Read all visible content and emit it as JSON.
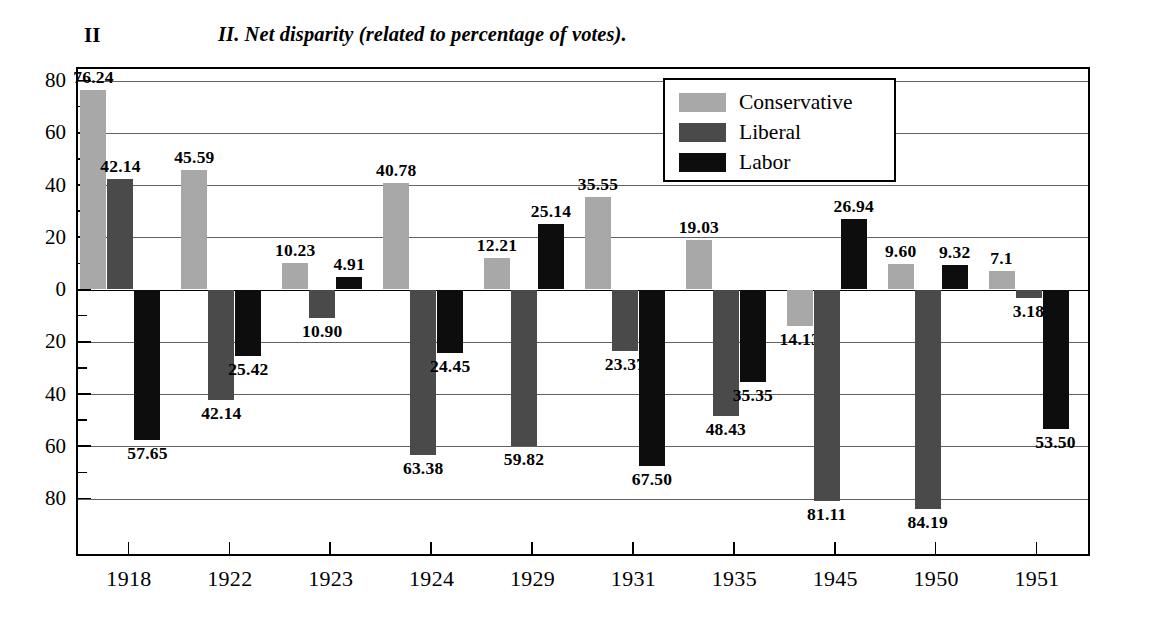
{
  "figure": {
    "number": "II",
    "title": "II. Net disparity (related to percentage of votes)."
  },
  "legend": {
    "position": "top-right",
    "entries": [
      {
        "label": "Conservative",
        "color": "#a8a8a8",
        "swatch_name": "legend-swatch-conservative"
      },
      {
        "label": "Liberal",
        "color": "#4a4a4a",
        "swatch_name": "legend-swatch-liberal"
      },
      {
        "label": "Labor",
        "color": "#0d0d0d",
        "swatch_name": "legend-swatch-labor"
      }
    ]
  },
  "axes": {
    "y_ticks": [
      "80",
      "60",
      "40",
      "20",
      "0",
      "20",
      "40",
      "60",
      "80"
    ],
    "x_ticks": [
      "1918",
      "1922",
      "1923",
      "1924",
      "1929",
      "1931",
      "1935",
      "1945",
      "1950",
      "1951"
    ]
  },
  "chart_data": {
    "type": "bar",
    "title": "II. Net disparity (related to percentage of votes).",
    "xlabel": "",
    "ylabel": "",
    "ylim": [
      -90,
      90
    ],
    "grid": true,
    "legend_position": "top-right",
    "categories": [
      "1918",
      "1922",
      "1923",
      "1924",
      "1929",
      "1931",
      "1935",
      "1945",
      "1950",
      "1951"
    ],
    "series": [
      {
        "name": "Conservative",
        "color": "#a8a8a8",
        "values": [
          76.24,
          45.59,
          10.23,
          40.78,
          12.21,
          35.55,
          19.03,
          -14.13,
          9.6,
          7.1
        ],
        "labels": [
          "76.24",
          "45.59",
          "10.23",
          "40.78",
          "12.21",
          "35.55",
          "19.03",
          "14.13",
          "9.60",
          "7.1"
        ]
      },
      {
        "name": "Liberal",
        "color": "#4a4a4a",
        "values": [
          42.14,
          -42.14,
          -10.9,
          -63.38,
          -59.82,
          -23.37,
          -48.43,
          -81.11,
          -84.19,
          -3.18
        ],
        "labels": [
          "42.14",
          "42.14",
          "10.90",
          "63.38",
          "59.82",
          "23.37",
          "48.43",
          "81.11",
          "84.19",
          "3.18"
        ]
      },
      {
        "name": "Labor",
        "color": "#0d0d0d",
        "values": [
          -57.65,
          -25.42,
          4.91,
          -24.45,
          25.14,
          -67.5,
          -35.35,
          26.94,
          9.32,
          -53.5
        ],
        "labels": [
          "57.65",
          "25.42",
          "4.91",
          "24.45",
          "25.14",
          "67.50",
          "35.35",
          "26.94",
          "9.32",
          "53.50"
        ]
      }
    ]
  }
}
